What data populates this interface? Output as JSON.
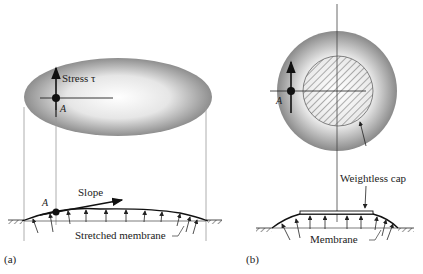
{
  "figure": {
    "panel_a": {
      "label": "(a)",
      "stress_label": "Stress τ",
      "point_label": "A",
      "point_label_lower": "A",
      "slope_label": "Slope",
      "membrane_label": "Stretched membrane"
    },
    "panel_b": {
      "label": "(b)",
      "point_label": "A",
      "cap_label": "Weightless cap",
      "membrane_label": "Membrane"
    }
  }
}
